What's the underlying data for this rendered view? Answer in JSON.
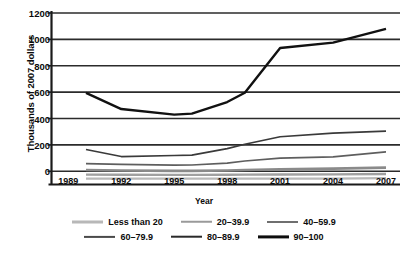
{
  "chart_data": {
    "type": "line",
    "title": "",
    "xlabel": "Year",
    "ylabel": "Thousands of 2007 dollars",
    "xlim": [
      1988,
      2008.5
    ],
    "ylim": [
      -100,
      1200
    ],
    "yticks": [
      0,
      200,
      400,
      600,
      800,
      1000,
      1200
    ],
    "ytick_labels": [
      "0",
      "200",
      "400",
      "600",
      "800",
      "1000",
      "1200"
    ],
    "xticks": [
      1989,
      1992,
      1995,
      1998,
      2001,
      2004,
      2007
    ],
    "xtick_labels": [
      "1989",
      "1992",
      "1995",
      "1998",
      "2001",
      "2004",
      "2007"
    ],
    "grid": "horizontal",
    "legend_position": "bottom",
    "x": [
      1990,
      1992,
      1995,
      1996,
      1998,
      1999,
      2001,
      2004,
      2007
    ],
    "series": [
      {
        "name": "Less than 20",
        "color": "#b8b8b8",
        "width": 2.2,
        "values": [
          -55,
          -55,
          -55,
          -55,
          -55,
          -55,
          -55,
          -55,
          -52
        ]
      },
      {
        "name": "20–39.9",
        "color": "#a0a0a0",
        "width": 2.4,
        "values": [
          -25,
          -26,
          -27,
          -27,
          -26,
          -25,
          -24,
          -23,
          -20
        ]
      },
      {
        "name": "40–59.9",
        "color": "#8a8a8a",
        "width": 2.6,
        "values": [
          10,
          6,
          3,
          3,
          6,
          10,
          16,
          20,
          28
        ]
      },
      {
        "name": "60–79.9",
        "color": "#5e5e5e",
        "width": 1.7,
        "values": [
          58,
          53,
          47,
          48,
          62,
          78,
          100,
          110,
          148
        ]
      },
      {
        "name": "80–89.9",
        "color": "#3a3a3a",
        "width": 1.7,
        "values": [
          165,
          112,
          120,
          122,
          172,
          205,
          262,
          290,
          305
        ]
      },
      {
        "name": "90–100",
        "color": "#111111",
        "width": 2.4,
        "values": [
          595,
          472,
          430,
          437,
          525,
          595,
          935,
          975,
          1080
        ]
      }
    ]
  },
  "axes": {
    "y_title": "Thousands of 2007 dollars",
    "x_title": "Year"
  },
  "legend": {
    "rows": [
      [
        {
          "label": "Less than 20",
          "color": "#b8b8b8",
          "thickness": "3px"
        },
        {
          "label": "20–39.9",
          "color": "#9a9a9a",
          "thickness": "2.5px"
        },
        {
          "label": "40–59.9",
          "color": "#6f6f6f",
          "thickness": "2px"
        }
      ],
      [
        {
          "label": "60–79.9",
          "color": "#4a4a4a",
          "thickness": "2.2px"
        },
        {
          "label": "80–89.9",
          "color": "#2a2a2a",
          "thickness": "2.6px"
        },
        {
          "label": "90–100",
          "color": "#0d0d0d",
          "thickness": "3.2px"
        }
      ]
    ]
  }
}
